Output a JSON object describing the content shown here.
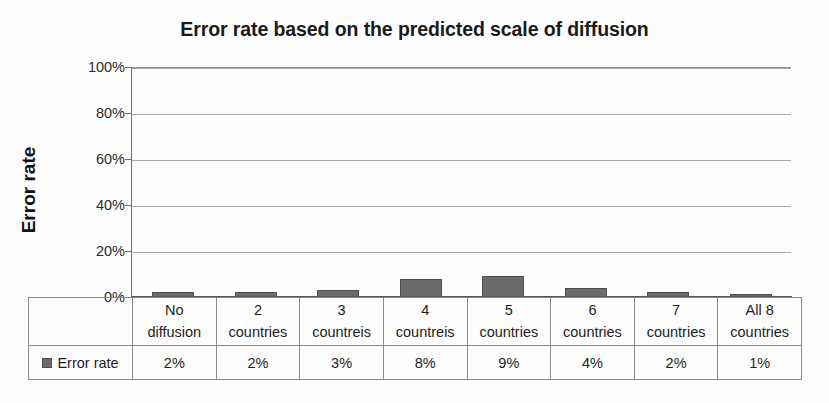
{
  "chart_data": {
    "type": "bar",
    "title": "Error rate based on the predicted scale of diffusion",
    "xlabel": "",
    "ylabel": "Error rate",
    "categories": [
      "No diffusion",
      "2 countries",
      "3 countreis",
      "4 countreis",
      "5 countries",
      "6 countries",
      "7 countries",
      "All 8 countries"
    ],
    "category_lines": [
      [
        "No",
        "diffusion"
      ],
      [
        "2",
        "countries"
      ],
      [
        "3",
        "countreis"
      ],
      [
        "4",
        "countreis"
      ],
      [
        "5",
        "countries"
      ],
      [
        "6",
        "countries"
      ],
      [
        "7",
        "countries"
      ],
      [
        "All 8",
        "countries"
      ]
    ],
    "values": [
      2,
      2,
      3,
      8,
      9,
      4,
      2,
      1
    ],
    "value_labels": [
      "2%",
      "2%",
      "3%",
      "8%",
      "9%",
      "4%",
      "2%",
      "1%"
    ],
    "series": [
      {
        "name": "Error rate",
        "values": [
          2,
          2,
          3,
          8,
          9,
          4,
          2,
          1
        ]
      }
    ],
    "ylim": [
      0,
      100
    ],
    "yticks": [
      0,
      20,
      40,
      60,
      80,
      100
    ],
    "ytick_labels": [
      "0%",
      "20%",
      "40%",
      "60%",
      "80%",
      "100%"
    ],
    "grid": true,
    "legend": {
      "position": "data-table",
      "entries": [
        "Error rate"
      ]
    },
    "colors": {
      "bar_fill": "#6b6b6b",
      "bar_border": "#4f4f4f",
      "gridline": "#a9a9a9",
      "axis": "#555555",
      "text": "#1d1d1d",
      "background": "#fdfdfd"
    },
    "data_table": {
      "visible": true,
      "row_label": "Error rate",
      "row_values": [
        "2%",
        "2%",
        "3%",
        "8%",
        "9%",
        "4%",
        "2%",
        "1%"
      ]
    }
  }
}
